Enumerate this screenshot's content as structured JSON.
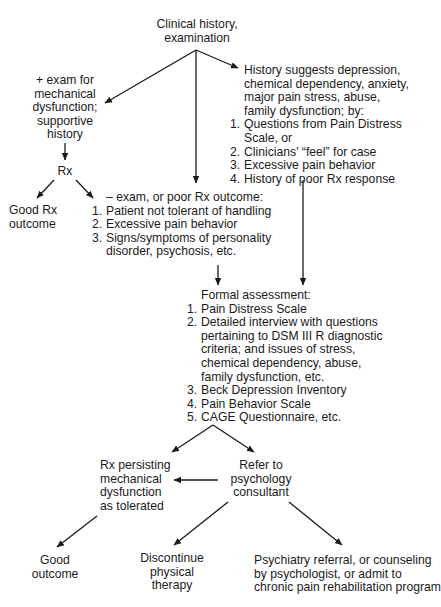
{
  "diagram": {
    "root": {
      "lines": [
        "Clinical history,",
        "examination"
      ]
    },
    "positive_exam": {
      "lines": [
        "+ exam for",
        "mechanical",
        "dysfunction;",
        "supportive",
        "history"
      ]
    },
    "history_suggests": {
      "intro": [
        "History suggests depression,",
        "chemical dependency, anxiety,",
        "major pain stress, abuse,",
        "family dysfunction; by:"
      ],
      "items": [
        {
          "num": "1.",
          "lines": [
            "Questions from Pain Distress",
            "Scale, or"
          ]
        },
        {
          "num": "2.",
          "lines": [
            "Clinicians' “feel” for case"
          ]
        },
        {
          "num": "3.",
          "lines": [
            "Excessive pain behavior"
          ]
        },
        {
          "num": "4.",
          "lines": [
            "History of poor Rx response"
          ]
        }
      ]
    },
    "rx": {
      "label": "Rx"
    },
    "good_rx_outcome": {
      "lines": [
        "Good Rx",
        "outcome"
      ]
    },
    "negative_exam": {
      "intro": "– exam, or poor Rx outcome:",
      "items": [
        {
          "num": "1.",
          "lines": [
            "Patient not tolerant of handling"
          ]
        },
        {
          "num": "2.",
          "lines": [
            "Excessive pain behavior"
          ]
        },
        {
          "num": "3.",
          "lines": [
            "Signs/symptoms of personality",
            "disorder, psychosis, etc."
          ]
        }
      ]
    },
    "formal_assessment": {
      "intro": "Formal assessment:",
      "items": [
        {
          "num": "1.",
          "lines": [
            "Pain Distress Scale"
          ]
        },
        {
          "num": "2.",
          "lines": [
            "Detailed interview with questions",
            "pertaining to DSM III R diagnostic",
            "criteria; and issues of stress,",
            "chemical dependency, abuse,",
            "family dysfunction, etc."
          ]
        },
        {
          "num": "3.",
          "lines": [
            "Beck Depression Inventory"
          ]
        },
        {
          "num": "4.",
          "lines": [
            "Pain Behavior Scale"
          ]
        },
        {
          "num": "5.",
          "lines": [
            "CAGE Questionnaire, etc."
          ]
        }
      ]
    },
    "rx_persisting": {
      "lines": [
        "Rx persisting",
        "mechanical",
        "dysfunction",
        "as tolerated"
      ]
    },
    "refer_psychology": {
      "lines": [
        "Refer to",
        "psychology",
        "consultant"
      ]
    },
    "good_outcome": {
      "lines": [
        "Good",
        "outcome"
      ]
    },
    "discontinue_pt": {
      "lines": [
        "Discontinue",
        "physical",
        "therapy"
      ]
    },
    "psychiatry_referral": {
      "lines": [
        "Psychiatry referral, or counseling",
        "by psychologist, or admit to",
        "chronic pain rehabilitation program"
      ]
    }
  },
  "colors": {
    "ink": "#1a1a1a",
    "background": "#ffffff"
  }
}
